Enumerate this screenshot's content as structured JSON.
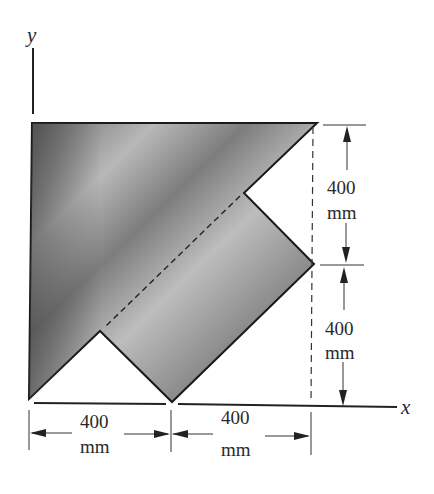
{
  "diagram": {
    "type": "composite-plate-area",
    "axes": {
      "x_label": "x",
      "y_label": "y"
    },
    "dimensions": {
      "right_top": {
        "value": "400",
        "unit": "mm"
      },
      "right_bottom": {
        "value": "400",
        "unit": "mm"
      },
      "bottom_left": {
        "value": "400",
        "unit": "mm"
      },
      "bottom_right": {
        "value": "400",
        "unit": "mm"
      }
    },
    "colors": {
      "fill_dark": "#4a4a4a",
      "fill_light": "#bdbdbd",
      "outline": "#1a1a1a",
      "background": "#ffffff"
    }
  }
}
